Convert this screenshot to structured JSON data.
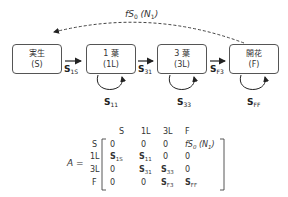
{
  "diagram": {
    "top_arrow_label": {
      "f": "f",
      "S": "S",
      "sub0": "0",
      "N": "N",
      "sub1": "1"
    },
    "nodes": [
      {
        "id": "S",
        "line1": "実生",
        "line2": "(S)"
      },
      {
        "id": "1L",
        "line1": "1 葉",
        "line2": "(1L)"
      },
      {
        "id": "3L",
        "line1": "3 葉",
        "line2": "(3L)"
      },
      {
        "id": "F",
        "line1": "開花",
        "line2": "(F)"
      }
    ],
    "transitions": [
      {
        "sym": "S",
        "sub": "1S"
      },
      {
        "sym": "S",
        "sub": "31"
      },
      {
        "sym": "S",
        "sub": "F3"
      }
    ],
    "self_loops": [
      {
        "sym": "S",
        "sub": "11"
      },
      {
        "sym": "S",
        "sub": "33"
      },
      {
        "sym": "S",
        "sub": "FF"
      }
    ]
  },
  "matrix": {
    "name": "A",
    "equals": "=",
    "col_headers": [
      "S",
      "1L",
      "3L",
      "F"
    ],
    "row_headers": [
      "S",
      "1L",
      "3L",
      "F"
    ],
    "rows": [
      [
        {
          "t": "0"
        },
        {
          "t": "0"
        },
        {
          "t": "0"
        },
        {
          "t": "fS0 (N1)"
        }
      ],
      [
        {
          "b": "S",
          "s": "1S"
        },
        {
          "b": "S",
          "s": "11"
        },
        {
          "t": "0"
        },
        {
          "t": "0"
        }
      ],
      [
        {
          "t": "0"
        },
        {
          "b": "S",
          "s": "31"
        },
        {
          "b": "S",
          "s": "33"
        },
        {
          "t": "0"
        }
      ],
      [
        {
          "t": "0"
        },
        {
          "t": "0"
        },
        {
          "b": "S",
          "s": "F3"
        },
        {
          "b": "S",
          "s": "FF"
        }
      ]
    ]
  }
}
